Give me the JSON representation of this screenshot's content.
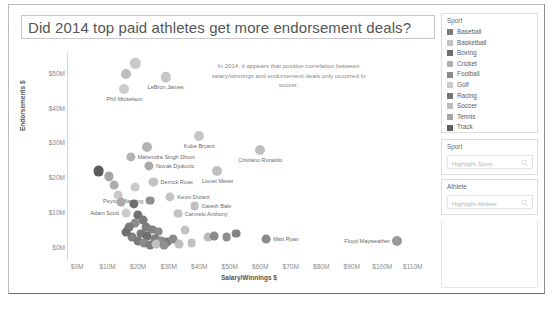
{
  "dashboard": {
    "title": "Did 2014 top paid athletes get more endorsement deals?"
  },
  "annotation": {
    "text": "In 2014, it appears that positive correlation between salary/winnings and endorsement deals only occurred in soccer."
  },
  "sidebar": {
    "legend": {
      "title": "Sport",
      "items": [
        {
          "label": "Baseball",
          "color": "#7a7a7a"
        },
        {
          "label": "Basketball",
          "color": "#c2c2c2"
        },
        {
          "label": "Boxing",
          "color": "#6e6e6e"
        },
        {
          "label": "Cricket",
          "color": "#b0b0b0"
        },
        {
          "label": "Football",
          "color": "#8a8a8a"
        },
        {
          "label": "Golf",
          "color": "#cbcbcb"
        },
        {
          "label": "Racing",
          "color": "#767676"
        },
        {
          "label": "Soccer",
          "color": "#bdbdbd"
        },
        {
          "label": "Tennis",
          "color": "#a4a4a4"
        },
        {
          "label": "Track",
          "color": "#5e5e5e"
        }
      ]
    },
    "sport_filter": {
      "title": "Sport",
      "placeholder": "Highlight Sport",
      "value": ""
    },
    "athlete_filter": {
      "title": "Athlete",
      "placeholder": "Highlight Athlete",
      "value": ""
    }
  },
  "chart_data": {
    "type": "scatter",
    "title": "Did 2014 top paid athletes get more endorsement deals?",
    "xlabel": "Salary/Winnings $",
    "ylabel": "Endorsements $",
    "xlim": [
      -3,
      115
    ],
    "ylim": [
      -3,
      56
    ],
    "xticks": [
      "$0M",
      "$10M",
      "$20M",
      "$30M",
      "$40M",
      "$50M",
      "$60M",
      "$70M",
      "$80M",
      "$90M",
      "$100M",
      "$110M"
    ],
    "xtickvals": [
      0,
      10,
      20,
      30,
      40,
      50,
      60,
      70,
      80,
      90,
      100,
      110
    ],
    "yticks": [
      "$0M",
      "$10M",
      "$20M",
      "$30M",
      "$40M",
      "$50M"
    ],
    "ytickvals": [
      0,
      10,
      20,
      30,
      40,
      50
    ],
    "grid": false,
    "legend_position": "right",
    "legend_title": "Sport",
    "points": [
      {
        "label": "",
        "sport": "Golf",
        "x": 19.0,
        "y": 53.0,
        "color": "#c9c9c9",
        "size": 5.2,
        "label_pos": "none"
      },
      {
        "label": "",
        "sport": "Golf",
        "x": 16.0,
        "y": 50.0,
        "color": "#bdbdbd",
        "size": 5.0,
        "label_pos": "none"
      },
      {
        "label": "LeBron James",
        "sport": "Basketball",
        "x": 29.0,
        "y": 49.0,
        "color": "#c6c6c6",
        "size": 5.2,
        "label_pos": "below"
      },
      {
        "label": "Phil Mickelson",
        "sport": "Golf",
        "x": 15.5,
        "y": 45.5,
        "color": "#cccccc",
        "size": 5.0,
        "label_pos": "below"
      },
      {
        "label": "Kobe Bryant",
        "sport": "Basketball",
        "x": 40.0,
        "y": 32.0,
        "color": "#c4c4c4",
        "size": 5.0,
        "label_pos": "below"
      },
      {
        "label": "",
        "sport": "Cricket",
        "x": 23.0,
        "y": 29.0,
        "color": "#b4b4b4",
        "size": 5.0,
        "label_pos": "none"
      },
      {
        "label": "Cristiano Ronaldo",
        "sport": "Soccer",
        "x": 60.0,
        "y": 28.0,
        "color": "#bfbfbf",
        "size": 5.0,
        "label_pos": "below"
      },
      {
        "label": "Mahendra Singh Dhoni",
        "sport": "Cricket",
        "x": 17.5,
        "y": 26.0,
        "color": "#b2b2b2",
        "size": 4.6,
        "label_pos": "right"
      },
      {
        "label": "Novak Djokovic",
        "sport": "Tennis",
        "x": 23.5,
        "y": 23.5,
        "color": "#a8a8a8",
        "size": 4.6,
        "label_pos": "right"
      },
      {
        "label": "",
        "sport": "Track",
        "x": 7.0,
        "y": 22.0,
        "color": "#5c5c5c",
        "size": 5.4,
        "label_pos": "none"
      },
      {
        "label": "Lionel Messi",
        "sport": "Soccer",
        "x": 46.0,
        "y": 22.0,
        "color": "#c0c0c0",
        "size": 5.0,
        "label_pos": "below"
      },
      {
        "label": "",
        "sport": "Tennis",
        "x": 10.5,
        "y": 20.5,
        "color": "#a6a6a6",
        "size": 4.6,
        "label_pos": "none"
      },
      {
        "label": "Derrick Rose",
        "sport": "Basketball",
        "x": 25.0,
        "y": 19.0,
        "color": "#c2c2c2",
        "size": 4.6,
        "label_pos": "right"
      },
      {
        "label": "",
        "sport": "Tennis",
        "x": 12.0,
        "y": 18.0,
        "color": "#ababab",
        "size": 4.4,
        "label_pos": "none"
      },
      {
        "label": "",
        "sport": "Golf",
        "x": 19.0,
        "y": 17.5,
        "color": "#c9c9c9",
        "size": 4.4,
        "label_pos": "none"
      },
      {
        "label": "Kevin Durant",
        "sport": "Basketball",
        "x": 30.5,
        "y": 14.5,
        "color": "#c4c4c4",
        "size": 4.6,
        "label_pos": "right"
      },
      {
        "label": "Peyton Manning",
        "sport": "Football",
        "x": 24.0,
        "y": 13.5,
        "color": "#8f8f8f",
        "size": 4.4,
        "label_pos": "left"
      },
      {
        "label": "Gareth Bale",
        "sport": "Soccer",
        "x": 38.5,
        "y": 12.0,
        "color": "#c0c0c0",
        "size": 4.4,
        "label_pos": "right"
      },
      {
        "label": "",
        "sport": "Boxing",
        "x": 18.5,
        "y": 12.5,
        "color": "#6d6d6d",
        "size": 4.6,
        "label_pos": "none"
      },
      {
        "label": "Adam Scott",
        "sport": "Golf",
        "x": 16.0,
        "y": 10.0,
        "color": "#cbcbcb",
        "size": 4.4,
        "label_pos": "left"
      },
      {
        "label": "Carmelo Anthony",
        "sport": "Basketball",
        "x": 33.0,
        "y": 9.8,
        "color": "#c2c2c2",
        "size": 4.4,
        "label_pos": "right"
      },
      {
        "label": "",
        "sport": "Boxing",
        "x": 20.0,
        "y": 9.5,
        "color": "#707070",
        "size": 4.6,
        "label_pos": "none"
      },
      {
        "label": "",
        "sport": "Racing",
        "x": 21.5,
        "y": 8.0,
        "color": "#7a7a7a",
        "size": 4.4,
        "label_pos": "none"
      },
      {
        "label": "",
        "sport": "Football",
        "x": 19.0,
        "y": 7.0,
        "color": "#8c8c8c",
        "size": 4.4,
        "label_pos": "none"
      },
      {
        "label": "",
        "sport": "Baseball",
        "x": 22.5,
        "y": 6.0,
        "color": "#7f7f7f",
        "size": 4.4,
        "label_pos": "none"
      },
      {
        "label": "",
        "sport": "Baseball",
        "x": 24.5,
        "y": 5.2,
        "color": "#828282",
        "size": 4.4,
        "label_pos": "none"
      },
      {
        "label": "",
        "sport": "Football",
        "x": 26.5,
        "y": 4.6,
        "color": "#8a8a8a",
        "size": 4.4,
        "label_pos": "none"
      },
      {
        "label": "",
        "sport": "Racing",
        "x": 21.0,
        "y": 4.0,
        "color": "#787878",
        "size": 4.4,
        "label_pos": "none"
      },
      {
        "label": "",
        "sport": "Boxing",
        "x": 23.0,
        "y": 3.2,
        "color": "#6e6e6e",
        "size": 4.4,
        "label_pos": "none"
      },
      {
        "label": "",
        "sport": "Baseball",
        "x": 25.5,
        "y": 2.6,
        "color": "#808080",
        "size": 4.4,
        "label_pos": "none"
      },
      {
        "label": "",
        "sport": "Football",
        "x": 27.5,
        "y": 2.0,
        "color": "#8d8d8d",
        "size": 4.4,
        "label_pos": "none"
      },
      {
        "label": "",
        "sport": "Baseball",
        "x": 29.5,
        "y": 1.6,
        "color": "#7d7d7d",
        "size": 4.4,
        "label_pos": "none"
      },
      {
        "label": "",
        "sport": "Football",
        "x": 31.5,
        "y": 2.4,
        "color": "#8a8a8a",
        "size": 4.4,
        "label_pos": "none"
      },
      {
        "label": "",
        "sport": "Baseball",
        "x": 18.0,
        "y": 3.0,
        "color": "#818181",
        "size": 4.4,
        "label_pos": "none"
      },
      {
        "label": "",
        "sport": "Racing",
        "x": 20.0,
        "y": 1.8,
        "color": "#797979",
        "size": 4.4,
        "label_pos": "none"
      },
      {
        "label": "",
        "sport": "Football",
        "x": 22.0,
        "y": 1.2,
        "color": "#8b8b8b",
        "size": 4.4,
        "label_pos": "none"
      },
      {
        "label": "",
        "sport": "Baseball",
        "x": 24.0,
        "y": 0.8,
        "color": "#7e7e7e",
        "size": 4.4,
        "label_pos": "none"
      },
      {
        "label": "",
        "sport": "Basketball",
        "x": 26.0,
        "y": 1.0,
        "color": "#c0c0c0",
        "size": 4.4,
        "label_pos": "none"
      },
      {
        "label": "",
        "sport": "Football",
        "x": 28.5,
        "y": 0.6,
        "color": "#8e8e8e",
        "size": 4.4,
        "label_pos": "none"
      },
      {
        "label": "",
        "sport": "Soccer",
        "x": 43.0,
        "y": 3.0,
        "color": "#bcbcbc",
        "size": 4.4,
        "label_pos": "none"
      },
      {
        "label": "",
        "sport": "Football",
        "x": 45.0,
        "y": 3.4,
        "color": "#8b8b8b",
        "size": 4.4,
        "label_pos": "none"
      },
      {
        "label": "",
        "sport": "Football",
        "x": 49.0,
        "y": 3.0,
        "color": "#8d8d8d",
        "size": 4.4,
        "label_pos": "none"
      },
      {
        "label": "",
        "sport": "Baseball",
        "x": 52.0,
        "y": 4.0,
        "color": "#838383",
        "size": 4.4,
        "label_pos": "none"
      },
      {
        "label": "Matt Ryan",
        "sport": "Football",
        "x": 62.0,
        "y": 2.4,
        "color": "#8c8c8c",
        "size": 4.4,
        "label_pos": "right"
      },
      {
        "label": "Floyd Mayweather",
        "sport": "Boxing",
        "x": 105.0,
        "y": 2.0,
        "color": "#9a9a9a",
        "size": 5.0,
        "label_pos": "left"
      },
      {
        "label": "",
        "sport": "Golf",
        "x": 13.5,
        "y": 15.0,
        "color": "#c9c9c9",
        "size": 4.4,
        "label_pos": "none"
      },
      {
        "label": "",
        "sport": "Tennis",
        "x": 14.5,
        "y": 13.0,
        "color": "#a9a9a9",
        "size": 4.4,
        "label_pos": "none"
      },
      {
        "label": "",
        "sport": "Racing",
        "x": 17.0,
        "y": 6.0,
        "color": "#7b7b7b",
        "size": 4.4,
        "label_pos": "none"
      },
      {
        "label": "",
        "sport": "Boxing",
        "x": 16.0,
        "y": 4.5,
        "color": "#6f6f6f",
        "size": 4.4,
        "label_pos": "none"
      },
      {
        "label": "",
        "sport": "Basketball",
        "x": 35.5,
        "y": 5.0,
        "color": "#c3c3c3",
        "size": 4.4,
        "label_pos": "none"
      },
      {
        "label": "",
        "sport": "Basketball",
        "x": 37.5,
        "y": 1.2,
        "color": "#c1c1c1",
        "size": 4.4,
        "label_pos": "none"
      },
      {
        "label": "",
        "sport": "Soccer",
        "x": 33.5,
        "y": 1.0,
        "color": "#bebebe",
        "size": 4.4,
        "label_pos": "none"
      }
    ]
  }
}
